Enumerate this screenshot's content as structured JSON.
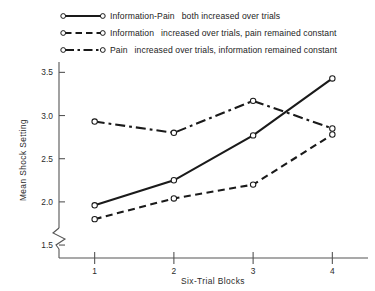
{
  "chart_data": {
    "type": "line",
    "title": "",
    "xlabel": "Six-Trial Blocks",
    "ylabel": "Mean Shock Setting",
    "categories": [
      "1",
      "2",
      "3",
      "4"
    ],
    "x": [
      1,
      2,
      3,
      4
    ],
    "xlim": [
      0.55,
      4.45
    ],
    "ylim": [
      1.35,
      3.62
    ],
    "yticks": [
      "1.5",
      "2.0",
      "2.5",
      "3.0",
      "3.5"
    ],
    "ytick_values": [
      1.5,
      2.0,
      2.5,
      3.0,
      3.5
    ],
    "xticks": [
      "1",
      "2",
      "3",
      "4"
    ],
    "grid": false,
    "axis_break": true,
    "legend_position": "above-plot",
    "series": [
      {
        "name": "Information-Pain",
        "note": "both increased over trials",
        "linestyle": "solid",
        "marker": "open-circle",
        "color": "#1a1a1a",
        "values": [
          1.96,
          2.25,
          2.77,
          3.43
        ]
      },
      {
        "name": "Information",
        "note": "increased over trials, pain remained constant",
        "linestyle": "dashed",
        "marker": "open-circle",
        "color": "#1a1a1a",
        "values": [
          1.8,
          2.04,
          2.2,
          2.78
        ]
      },
      {
        "name": "Pain",
        "note": "increased over trials, information remained constant",
        "linestyle": "dash-dot",
        "marker": "open-circle",
        "color": "#1a1a1a",
        "values": [
          2.93,
          2.8,
          3.17,
          2.85
        ]
      }
    ]
  },
  "legend": {
    "items": [
      {
        "lead": "Information-Pain",
        "rest": "both increased over trials"
      },
      {
        "lead": "Information",
        "rest": "increased over trials, pain remained constant"
      },
      {
        "lead": "Pain",
        "rest": "increased over trials, information remained constant"
      }
    ]
  },
  "axes": {
    "x_label": "Six-Trial Blocks",
    "y_label": "Mean Shock Setting",
    "x_tick_labels": [
      "1",
      "2",
      "3",
      "4"
    ],
    "y_tick_labels": [
      "1.5",
      "2.0",
      "2.5",
      "3.0",
      "3.5"
    ]
  },
  "colors": {
    "ink": "#1a1a1a",
    "axis": "#555555",
    "background": "#ffffff"
  }
}
